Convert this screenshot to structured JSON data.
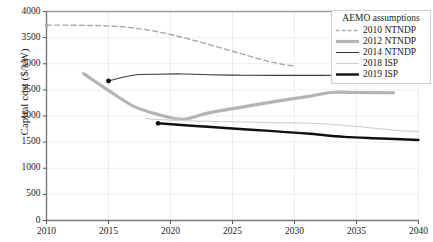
{
  "chart_data": {
    "type": "line",
    "title": "",
    "xlabel": "",
    "ylabel": "Capital cost ($/kW)",
    "xlim": [
      2010,
      2040
    ],
    "ylim": [
      0,
      4000
    ],
    "xticks": [
      2010,
      2015,
      2020,
      2025,
      2030,
      2035,
      2040
    ],
    "yticks": [
      0,
      500,
      1000,
      1500,
      2000,
      2500,
      3000,
      3500,
      4000
    ],
    "grid": true,
    "legend_position": "top-right",
    "legend_title": "AEMO assumptions",
    "series": [
      {
        "name": "2010 NTNDP",
        "color": "#a8a8a8",
        "style": "dashed",
        "width": 1.4,
        "marker_start": true,
        "x": [
          2010,
          2013,
          2016,
          2019,
          2022,
          2025,
          2028,
          2030
        ],
        "values": [
          3740,
          3735,
          3710,
          3610,
          3440,
          3240,
          3040,
          2955
        ]
      },
      {
        "name": "2012 NTNDP",
        "color": "#b4b4b4",
        "style": "solid",
        "width": 3.2,
        "marker_start": false,
        "x": [
          2013,
          2015,
          2017,
          2019,
          2021,
          2023,
          2026,
          2029,
          2031,
          2033,
          2035,
          2038
        ],
        "values": [
          2810,
          2490,
          2190,
          2030,
          1935,
          2055,
          2180,
          2300,
          2370,
          2450,
          2450,
          2445
        ]
      },
      {
        "name": "2014 NTNDP",
        "color": "#3a3a3a",
        "style": "solid",
        "width": 1.1,
        "marker_start": true,
        "x": [
          2015,
          2017,
          2019,
          2021,
          2023,
          2026,
          2029,
          2032,
          2035,
          2038,
          2040
        ],
        "values": [
          2670,
          2780,
          2800,
          2805,
          2790,
          2780,
          2778,
          2778,
          2780,
          2782,
          2785
        ]
      },
      {
        "name": "2018 ISP",
        "color": "#d2d2d2",
        "style": "solid",
        "width": 1.2,
        "marker_start": false,
        "x": [
          2018,
          2020,
          2023,
          2026,
          2029,
          2032,
          2035,
          2038,
          2040
        ],
        "values": [
          1950,
          1920,
          1900,
          1885,
          1870,
          1855,
          1800,
          1730,
          1700
        ]
      },
      {
        "name": "2019 ISP",
        "color": "#111111",
        "style": "solid",
        "width": 2.4,
        "marker_start": true,
        "x": [
          2019,
          2022,
          2025,
          2028,
          2031,
          2034,
          2037,
          2040
        ],
        "values": [
          1860,
          1810,
          1760,
          1715,
          1665,
          1600,
          1570,
          1540
        ]
      }
    ]
  },
  "axes": {
    "y_title": "Capital cost ($/kW)",
    "y_tick_labels": [
      "4000",
      "3500",
      "3000",
      "2500",
      "2000",
      "1500",
      "1000",
      "500",
      "0"
    ],
    "x_tick_labels": [
      "2010",
      "2015",
      "2020",
      "2025",
      "2030",
      "2035",
      "2040"
    ]
  },
  "legend": {
    "title": "AEMO assumptions",
    "items": [
      {
        "label": "2010 NTNDP"
      },
      {
        "label": "2012 NTNDP"
      },
      {
        "label": "2014 NTNDP"
      },
      {
        "label": "2018 ISP"
      },
      {
        "label": "2019 ISP"
      }
    ]
  }
}
